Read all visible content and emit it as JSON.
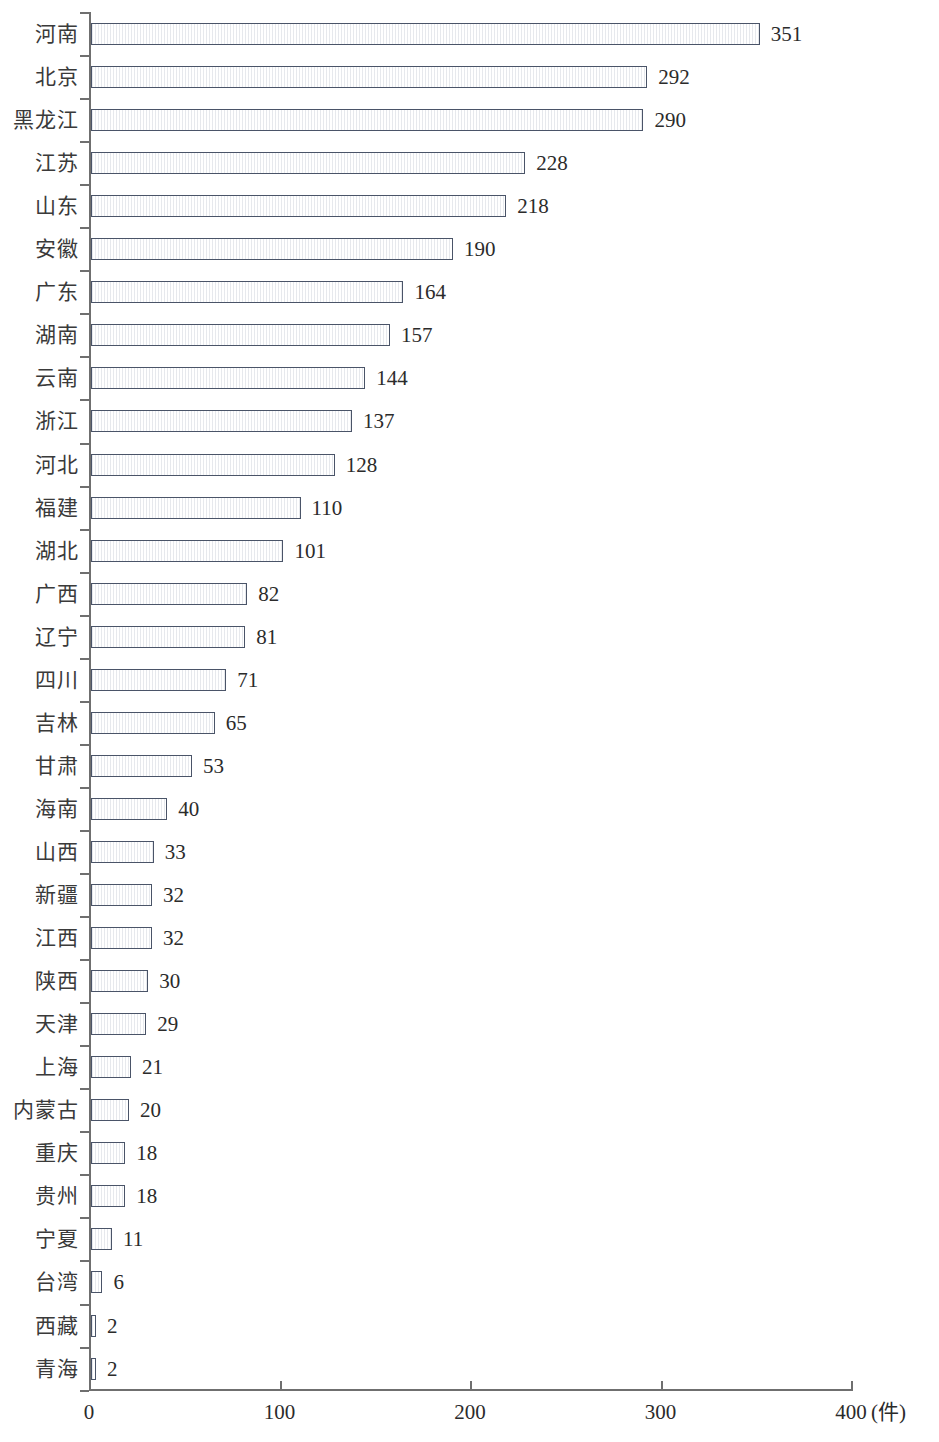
{
  "chart_data": {
    "type": "bar",
    "orientation": "horizontal",
    "title": "",
    "subtitle": "",
    "xlabel": "(件)",
    "ylabel": "",
    "xlim": [
      0,
      400
    ],
    "xticks": [
      0,
      100,
      200,
      300,
      400
    ],
    "xtick_labels": [
      "0",
      "100",
      "200",
      "300",
      "400"
    ],
    "grid": false,
    "legend": false,
    "legend_position": "none",
    "categories": [
      "河南",
      "北京",
      "黑龙江",
      "江苏",
      "山东",
      "安徽",
      "广东",
      "湖南",
      "云南",
      "浙江",
      "河北",
      "福建",
      "湖北",
      "广西",
      "辽宁",
      "四川",
      "吉林",
      "甘肃",
      "海南",
      "山西",
      "新疆",
      "江西",
      "陕西",
      "天津",
      "上海",
      "内蒙古",
      "重庆",
      "贵州",
      "宁夏",
      "台湾",
      "西藏",
      "青海"
    ],
    "values": [
      351,
      292,
      290,
      228,
      218,
      190,
      164,
      157,
      144,
      137,
      128,
      110,
      101,
      82,
      81,
      71,
      65,
      53,
      40,
      33,
      32,
      32,
      30,
      29,
      21,
      20,
      18,
      18,
      11,
      6,
      2,
      2
    ],
    "value_labels": [
      "351",
      "292",
      "290",
      "228",
      "218",
      "190",
      "164",
      "157",
      "144",
      "137",
      "128",
      "110",
      "101",
      "82",
      "81",
      "71",
      "65",
      "53",
      "40",
      "33",
      "32",
      "32",
      "30",
      "29",
      "21",
      "20",
      "18",
      "18",
      "11",
      "6",
      "2",
      "2"
    ],
    "colors": {
      "bar_border": "#4a5468",
      "bar_light": "#ffffff",
      "bar_mid": "#c3cbdc",
      "bar_dark": "#5a6479",
      "axis": "#6f6f6f",
      "text": "#2b2b2b",
      "background": "#ffffff"
    }
  }
}
